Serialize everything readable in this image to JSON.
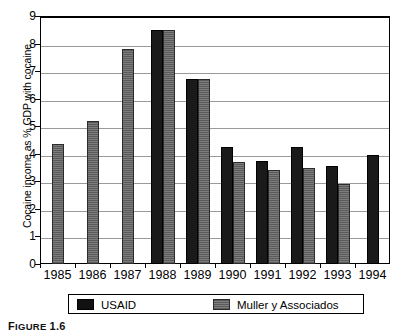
{
  "chart_data": {
    "type": "bar",
    "title": "",
    "xlabel": "",
    "ylabel": "Cocaine income as % GDP with cocaine",
    "categories": [
      "1985",
      "1986",
      "1987",
      "1988",
      "1989",
      "1990",
      "1991",
      "1992",
      "1993",
      "1994"
    ],
    "ylim": [
      0,
      9
    ],
    "ytick_labels": [
      "0",
      "1",
      "2",
      "3",
      "4",
      "5",
      "6",
      "7",
      "8",
      "9"
    ],
    "ytick_values": [
      0,
      1,
      2,
      3,
      4,
      5,
      6,
      7,
      8,
      9
    ],
    "grid": true,
    "legend_position": "bottom",
    "series": [
      {
        "name": "USAID",
        "color": "#111111",
        "values": [
          null,
          null,
          null,
          8.5,
          6.7,
          4.25,
          3.75,
          4.25,
          3.55,
          3.95
        ]
      },
      {
        "name": "Muller y Associados",
        "color": "#6e6e6e",
        "values": [
          4.35,
          5.2,
          7.8,
          8.5,
          6.7,
          3.7,
          3.4,
          3.5,
          2.9,
          null
        ]
      }
    ]
  },
  "figure": {
    "caption_lead": "F",
    "caption_rest": "IGURE",
    "caption_number": "1.6"
  },
  "legend": {
    "entries": [
      {
        "label": "USAID",
        "swatch": "black-swatch"
      },
      {
        "label": "Muller y Associados",
        "swatch": "gray-hatch-swatch"
      }
    ]
  }
}
